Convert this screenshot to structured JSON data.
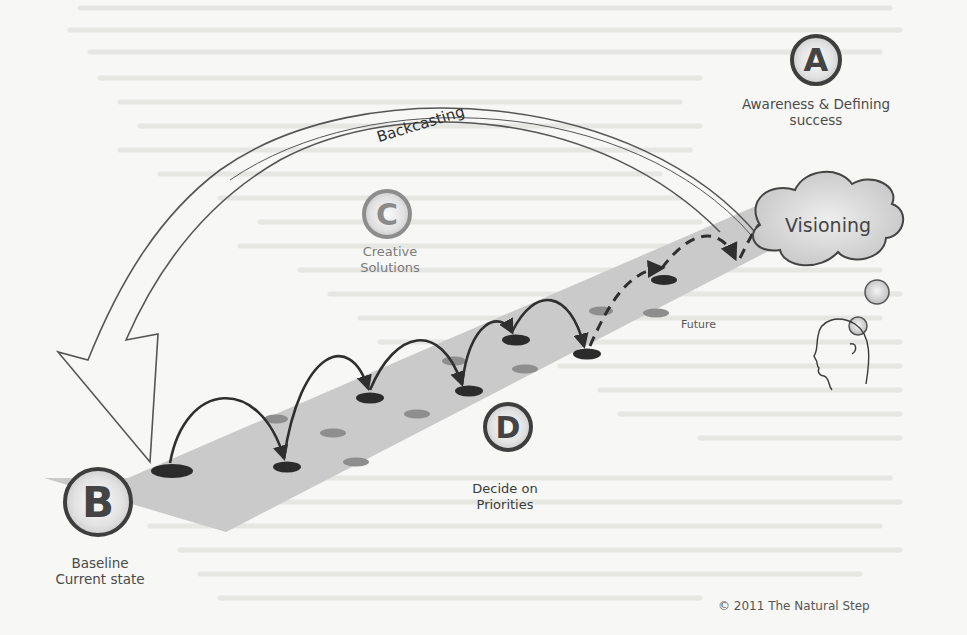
{
  "diagram": {
    "steps": [
      {
        "letter": "A",
        "label_lines": [
          "Awareness & Defining",
          "success"
        ]
      },
      {
        "letter": "B",
        "label_lines": [
          "Baseline",
          "Current state"
        ]
      },
      {
        "letter": "C",
        "label_lines": [
          "Creative",
          "Solutions"
        ]
      },
      {
        "letter": "D",
        "label_lines": [
          "Decide on",
          "Priorities"
        ]
      }
    ],
    "arc_label": "Backcasting",
    "cloud_label": "Visioning",
    "path_end_label": "Future",
    "copyright": "© 2011 The Natural Step",
    "colors": {
      "ink": "#2f2f2f",
      "path": "#c9c9c9",
      "disc_dark": "#2b2b2b",
      "disc_mid": "#8e8e8e",
      "label": "#4a4a4a"
    }
  }
}
